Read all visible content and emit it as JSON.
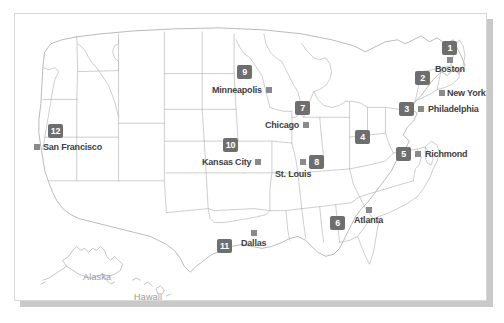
{
  "figure": {
    "colors": {
      "background": "#ffffff",
      "frame_border": "#d8d8d8",
      "shadow": "#c9c9c9",
      "state_outline": "#b4b4b4",
      "coast_outline": "#a0a0a0",
      "badge_fill": "#6e6e6e",
      "badge_text": "#ffffff",
      "dot_fill": "#8a8a8a",
      "city_label": "#404040",
      "inset_label": "#9a9a9a"
    }
  },
  "markers": [
    {
      "number": "1",
      "label": "Boston",
      "layout": "badge-above-dot-label-below"
    },
    {
      "number": "2",
      "label": "New York",
      "layout": "badge-upper-left-dot-label-right"
    },
    {
      "number": "3",
      "label": "Philadelphia",
      "layout": "badge-dot-label-inline"
    },
    {
      "number": "4",
      "label": "",
      "layout": "badge-only"
    },
    {
      "number": "5",
      "label": "Richmond",
      "layout": "badge-dot-label-inline"
    },
    {
      "number": "6",
      "label": "Atlanta",
      "layout": "badge-left-dot-above-label"
    },
    {
      "number": "7",
      "label": "Chicago",
      "layout": "badge-above-label-left-of-dot"
    },
    {
      "number": "8",
      "label": "St. Louis",
      "layout": "dot-badge-right-label-below"
    },
    {
      "number": "9",
      "label": "Minneapolis",
      "layout": "badge-above-label-left-of-dot"
    },
    {
      "number": "10",
      "label": "Kansas City",
      "layout": "badge-above-label-left-of-dot"
    },
    {
      "number": "11",
      "label": "Dallas",
      "layout": "badge-left-dot-above-label"
    },
    {
      "number": "12",
      "label": "San Francisco",
      "layout": "badge-above-dot-label-inline"
    }
  ],
  "insets": [
    {
      "name": "alaska",
      "label": "Alaska"
    },
    {
      "name": "hawaii",
      "label": "Hawaii"
    }
  ]
}
